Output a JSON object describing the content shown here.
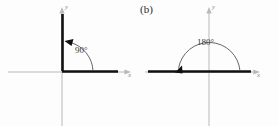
{
  "figure": {
    "background_color": "#fdfdfd",
    "axis_color": "#b9b9b9",
    "ray_color": "#101010",
    "arc_color": "#555555",
    "text_color": "#2b2b2b"
  },
  "panels": [
    {
      "id": "a",
      "label": ")",
      "label_full": "(a)",
      "angle_label": "90°",
      "angle_degrees": 90,
      "x_axis_label": "x",
      "y_axis_label": "y",
      "rotation_direction": "counterclockwise",
      "initial_side": "positive x-axis",
      "terminal_side": "positive y-axis"
    },
    {
      "id": "b",
      "label": "(b)",
      "label_full": "(b)",
      "angle_label": "180°",
      "angle_degrees": 180,
      "x_axis_label": "x",
      "y_axis_label": "y",
      "rotation_direction": "counterclockwise",
      "initial_side": "positive x-axis",
      "terminal_side": "negative x-axis"
    }
  ]
}
